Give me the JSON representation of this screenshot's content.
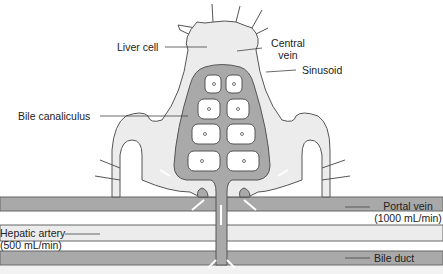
{
  "diagram": {
    "labels": {
      "central_vein_1": "Central",
      "central_vein_2": "vein",
      "liver_cell": "Liver cell",
      "sinusoid": "Sinusoid",
      "bile_canaliculus": "Bile canaliculus",
      "portal_vein_1": "Portal vein",
      "portal_vein_2": "(1000 mL/min)",
      "hepatic_artery_1": "Hepatic artery",
      "hepatic_artery_2": "(500 mL/min)",
      "bile_duct": "Bile duct"
    },
    "colors": {
      "light_fill": "#ececec",
      "dark_fill": "#a9a9a9",
      "outline": "#555555",
      "cell_fill": "#ffffff"
    }
  }
}
